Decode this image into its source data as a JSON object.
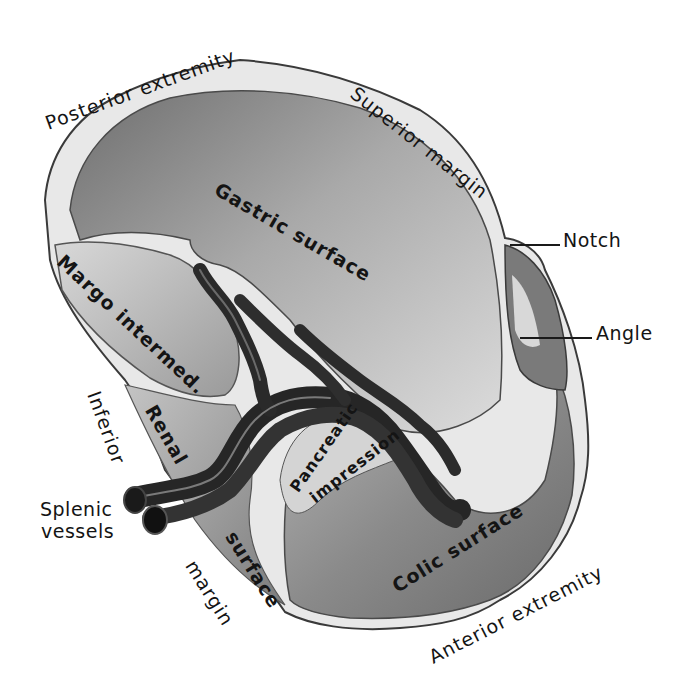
{
  "figure": {
    "colors": {
      "background": "#ffffff",
      "rim_light": "#e6e6e6",
      "rim_dark": "#5a5a5a",
      "gastric_surface": "#9a9a9a",
      "gastric_light": "#cfcfcf",
      "colic_surface": "#8c8c8c",
      "renal_surface": "#a8a8a8",
      "vessels": "#2a2a2a",
      "label_text": "#141414"
    }
  },
  "labels": {
    "posterior_extremity": "Posterior extremity",
    "superior_margin": "Superior margin",
    "notch": "Notch",
    "angle": "Angle",
    "gastric_surface": "Gastric surface",
    "margo_intermed": "Margo intermed.",
    "inferior": "Inferior",
    "renal": "Renal",
    "splenic_vessels_line1": "Splenic",
    "splenic_vessels_line2": "vessels",
    "surface": "surface",
    "margin": "margin",
    "pancreatic": "Pancreatic",
    "impression": "impression",
    "colic_surface": "Colic surface",
    "anterior_extremity": "Anterior extremity"
  }
}
